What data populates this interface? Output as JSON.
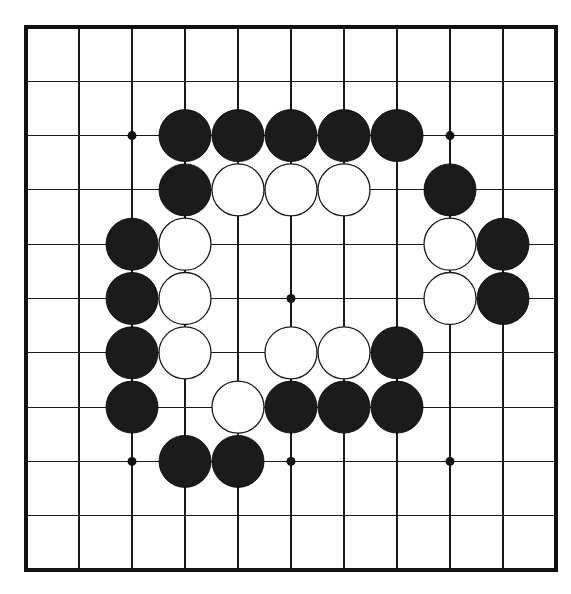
{
  "app": {
    "title": "Go Board Diagram",
    "board_label": "goban"
  },
  "board": {
    "size": 11,
    "lines": 11,
    "background_color": "#ffffff",
    "line_color": "#1a1a1a",
    "border_color": "#111111",
    "black_color": "#1b1b1b",
    "white_color": "#ffffff",
    "origin_x": 26,
    "origin_y": 27,
    "step_x": 53.0,
    "step_y": 54.3,
    "stone_radius": 26,
    "hoshi_radius": 4.5,
    "hoshi_points": [
      {
        "col": 2,
        "row": 2
      },
      {
        "col": 8,
        "row": 2
      },
      {
        "col": 2,
        "row": 5
      },
      {
        "col": 5,
        "row": 5
      },
      {
        "col": 8,
        "row": 5
      },
      {
        "col": 2,
        "row": 8
      },
      {
        "col": 5,
        "row": 8
      },
      {
        "col": 8,
        "row": 8
      }
    ],
    "stones": [
      {
        "col": 3,
        "row": 2,
        "color": "black"
      },
      {
        "col": 4,
        "row": 2,
        "color": "black"
      },
      {
        "col": 5,
        "row": 2,
        "color": "black"
      },
      {
        "col": 6,
        "row": 2,
        "color": "black"
      },
      {
        "col": 7,
        "row": 2,
        "color": "black"
      },
      {
        "col": 3,
        "row": 3,
        "color": "black"
      },
      {
        "col": 4,
        "row": 3,
        "color": "white"
      },
      {
        "col": 5,
        "row": 3,
        "color": "white"
      },
      {
        "col": 6,
        "row": 3,
        "color": "white"
      },
      {
        "col": 8,
        "row": 3,
        "color": "black"
      },
      {
        "col": 2,
        "row": 4,
        "color": "black"
      },
      {
        "col": 3,
        "row": 4,
        "color": "white"
      },
      {
        "col": 8,
        "row": 4,
        "color": "white"
      },
      {
        "col": 9,
        "row": 4,
        "color": "black"
      },
      {
        "col": 2,
        "row": 5,
        "color": "black"
      },
      {
        "col": 3,
        "row": 5,
        "color": "white"
      },
      {
        "col": 8,
        "row": 5,
        "color": "white"
      },
      {
        "col": 9,
        "row": 5,
        "color": "black"
      },
      {
        "col": 2,
        "row": 6,
        "color": "black"
      },
      {
        "col": 3,
        "row": 6,
        "color": "white"
      },
      {
        "col": 5,
        "row": 6,
        "color": "white"
      },
      {
        "col": 6,
        "row": 6,
        "color": "white"
      },
      {
        "col": 7,
        "row": 6,
        "color": "black"
      },
      {
        "col": 2,
        "row": 7,
        "color": "black"
      },
      {
        "col": 4,
        "row": 7,
        "color": "white"
      },
      {
        "col": 5,
        "row": 7,
        "color": "black"
      },
      {
        "col": 6,
        "row": 7,
        "color": "black"
      },
      {
        "col": 7,
        "row": 7,
        "color": "black"
      },
      {
        "col": 3,
        "row": 8,
        "color": "black"
      },
      {
        "col": 4,
        "row": 8,
        "color": "black"
      }
    ]
  },
  "counts": {
    "black_stones": 20,
    "white_stones": 10,
    "total_stones": 30
  }
}
